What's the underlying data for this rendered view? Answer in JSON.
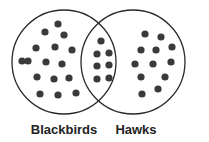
{
  "diagram": {
    "type": "venn",
    "sets": [
      {
        "name": "Blackbirds",
        "label": "Blackbirds",
        "circle": {
          "cx": 64,
          "cy": 62,
          "r": 52
        },
        "only_count": 16
      },
      {
        "name": "Hawks",
        "label": "Hawks",
        "circle": {
          "cx": 133,
          "cy": 62,
          "r": 52
        },
        "only_count": 12
      }
    ],
    "intersection_count": 7,
    "colors": {
      "stroke": "#2a2a2a",
      "dot": "#3a3a3a",
      "label": "#222222",
      "background": "#ffffff"
    },
    "dots": {
      "blackbirds_only": [
        [
          58,
          24
        ],
        [
          45,
          32
        ],
        [
          64,
          35
        ],
        [
          36,
          48
        ],
        [
          55,
          47
        ],
        [
          72,
          50
        ],
        [
          28,
          61
        ],
        [
          46,
          62
        ],
        [
          62,
          64
        ],
        [
          37,
          77
        ],
        [
          54,
          79
        ],
        [
          69,
          78
        ],
        [
          40,
          94
        ],
        [
          58,
          95
        ],
        [
          76,
          93
        ],
        [
          22,
          61
        ]
      ],
      "both": [
        [
          101,
          41
        ],
        [
          97,
          54
        ],
        [
          109,
          53
        ],
        [
          97,
          66
        ],
        [
          109,
          65
        ],
        [
          97,
          79
        ],
        [
          109,
          78
        ]
      ],
      "hawks_only": [
        [
          145,
          34
        ],
        [
          161,
          37
        ],
        [
          141,
          50
        ],
        [
          156,
          50
        ],
        [
          135,
          64
        ],
        [
          153,
          64
        ],
        [
          171,
          62
        ],
        [
          141,
          77
        ],
        [
          165,
          77
        ],
        [
          142,
          94
        ],
        [
          158,
          89
        ],
        [
          172,
          47
        ]
      ]
    }
  }
}
